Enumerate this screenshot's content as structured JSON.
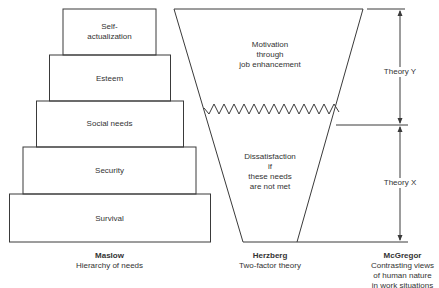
{
  "maslow": {
    "levels": [
      {
        "label": "Self-\nactualization",
        "line1": "Self-",
        "line2": "actualization"
      },
      {
        "label": "Esteem"
      },
      {
        "label": "Social needs"
      },
      {
        "label": "Security"
      },
      {
        "label": "Survival"
      }
    ],
    "caption_title": "Maslow",
    "caption_sub": "Hierarchy of needs"
  },
  "herzberg": {
    "upper_line1": "Motivation",
    "upper_line2": "through",
    "upper_line3": "job enhancement",
    "lower_line1": "Dissatisfaction",
    "lower_line2": "if",
    "lower_line3": "these needs",
    "lower_line4": "are not met",
    "caption_title": "Herzberg",
    "caption_sub": "Two-factor theory"
  },
  "mcgregor": {
    "upper_label": "Theory Y",
    "lower_label": "Theory X",
    "caption_title": "McGregor",
    "caption_line1": "Contrasting views",
    "caption_line2": "of human nature",
    "caption_line3": "in work situations"
  },
  "colors": {
    "line": "#3a3a3a",
    "background": "#ffffff"
  }
}
